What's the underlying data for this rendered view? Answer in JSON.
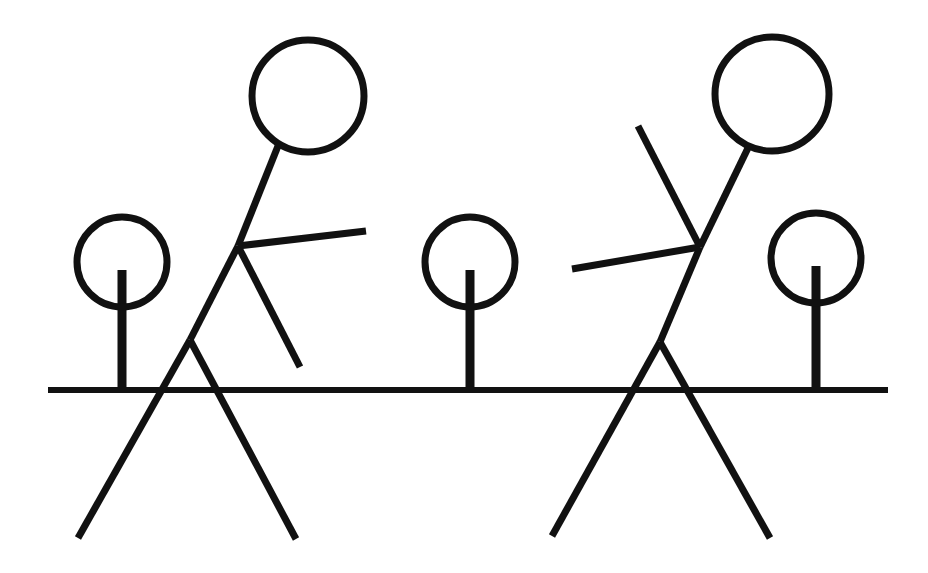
{
  "scene": {
    "title": "Stick figures and trees line drawing",
    "width": 928,
    "height": 573,
    "background_color": "#ffffff",
    "ink_color": "#111111"
  },
  "ground": {
    "name": "ground-line",
    "x1": 48,
    "y1": 390,
    "x2": 888,
    "y2": 390,
    "thickness": 6
  },
  "trees": [
    {
      "name": "tree-left",
      "canopy": {
        "cx": 122,
        "cy": 262,
        "r": 45,
        "thickness": 7
      },
      "trunk": {
        "x": 122,
        "y_top": 270,
        "y_bottom": 392,
        "thickness": 9
      }
    },
    {
      "name": "tree-middle",
      "canopy": {
        "cx": 470,
        "cy": 262,
        "r": 45,
        "thickness": 7
      },
      "trunk": {
        "x": 470,
        "y_top": 270,
        "y_bottom": 392,
        "thickness": 9
      }
    },
    {
      "name": "tree-right",
      "canopy": {
        "cx": 816,
        "cy": 258,
        "r": 45,
        "thickness": 7
      },
      "trunk": {
        "x": 816,
        "y_top": 266,
        "y_bottom": 392,
        "thickness": 9
      }
    }
  ],
  "figures": [
    {
      "name": "stick-figure-left",
      "facing": "right",
      "head": {
        "cx": 308,
        "cy": 96,
        "r": 56,
        "thickness": 7
      },
      "neck": {
        "x1": 278,
        "y1": 146,
        "x2": 238,
        "y2": 246,
        "thickness": 7
      },
      "torso": {
        "x1": 238,
        "y1": 246,
        "x2": 190,
        "y2": 340,
        "thickness": 7
      },
      "arms": [
        {
          "label": "arm-upper-right",
          "x1": 238,
          "y1": 246,
          "x2": 366,
          "y2": 231,
          "thickness": 7
        },
        {
          "label": "arm-lower-right",
          "x1": 238,
          "y1": 246,
          "x2": 300,
          "y2": 367,
          "thickness": 7
        }
      ],
      "legs": [
        {
          "label": "leg-left",
          "x1": 190,
          "y1": 340,
          "x2": 78,
          "y2": 538,
          "thickness": 7
        },
        {
          "label": "leg-right",
          "x1": 190,
          "y1": 340,
          "x2": 296,
          "y2": 539,
          "thickness": 7
        }
      ]
    },
    {
      "name": "stick-figure-right",
      "facing": "left",
      "head": {
        "cx": 772,
        "cy": 94,
        "r": 57,
        "thickness": 7
      },
      "neck": {
        "x1": 748,
        "y1": 148,
        "x2": 700,
        "y2": 247,
        "thickness": 7
      },
      "torso": {
        "x1": 700,
        "y1": 247,
        "x2": 660,
        "y2": 342,
        "thickness": 7
      },
      "arms": [
        {
          "label": "arm-upper-left",
          "x1": 700,
          "y1": 247,
          "x2": 638,
          "y2": 126,
          "thickness": 7
        },
        {
          "label": "arm-lower-left",
          "x1": 700,
          "y1": 247,
          "x2": 572,
          "y2": 269,
          "thickness": 7
        }
      ],
      "legs": [
        {
          "label": "leg-left",
          "x1": 660,
          "y1": 342,
          "x2": 552,
          "y2": 536,
          "thickness": 7
        },
        {
          "label": "leg-right",
          "x1": 660,
          "y1": 342,
          "x2": 770,
          "y2": 538,
          "thickness": 7
        }
      ]
    }
  ]
}
